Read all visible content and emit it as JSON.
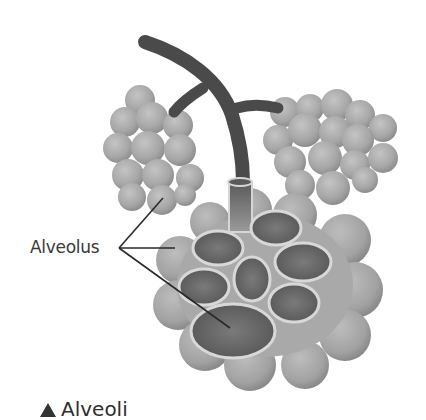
{
  "figure": {
    "title": "Alveoli",
    "caption_marker": "triangle-up",
    "labels": {
      "alveolus": "Alveolus"
    },
    "colors": {
      "bronchiole": "#4a4a4a",
      "alveolus_sac": "#a8a8a8",
      "alveolus_inner": "#686868",
      "rim": "#d6d6d6",
      "leader_line": "#2a2a2a"
    }
  }
}
